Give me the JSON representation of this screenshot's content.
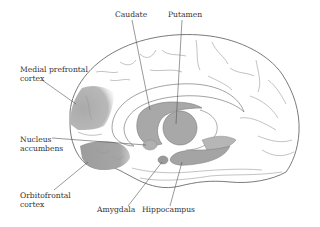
{
  "diagram": {
    "colors": {
      "background": "#ffffff",
      "outline": "#6b6b6b",
      "fold": "#9a9a9a",
      "shaded_region": "#b3b3b3",
      "deep_structure": "#a8a8a8",
      "label_text": "#333333",
      "leader_line": "#555555"
    },
    "labels": {
      "caudate": "Caudate",
      "putamen": "Putamen",
      "medial_prefrontal_cortex": "Medial prefrontal\ncortex",
      "nucleus_accumbens": "Nucleus\naccumbens",
      "orbitofrontal_cortex": "Orbitofrontal\ncortex",
      "amygdala": "Amygdala",
      "hippocampus": "Hippocampus"
    }
  }
}
